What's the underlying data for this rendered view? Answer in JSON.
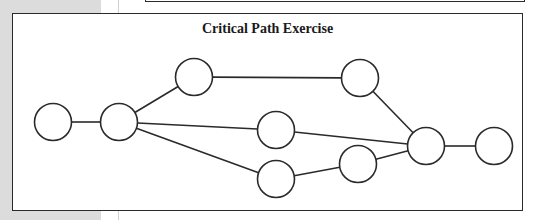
{
  "diagram": {
    "title": "Critical Path Exercise",
    "colors": {
      "stroke": "#2a2a2a",
      "node_fill": "#ffffff",
      "background": "#ffffff",
      "margin": "#dcdcdc"
    },
    "nodes": [
      {
        "id": "n1",
        "cx": 53,
        "cy": 122,
        "r": 18.5
      },
      {
        "id": "n2",
        "cx": 119,
        "cy": 122,
        "r": 18.5
      },
      {
        "id": "n3",
        "cx": 194,
        "cy": 77,
        "r": 18.5
      },
      {
        "id": "n4",
        "cx": 360,
        "cy": 78,
        "r": 18.5
      },
      {
        "id": "n5",
        "cx": 276,
        "cy": 130,
        "r": 18.5
      },
      {
        "id": "n6",
        "cx": 276,
        "cy": 179,
        "r": 18.5
      },
      {
        "id": "n7",
        "cx": 358,
        "cy": 164,
        "r": 18.5
      },
      {
        "id": "n8",
        "cx": 426,
        "cy": 146,
        "r": 18.5
      },
      {
        "id": "n9",
        "cx": 494,
        "cy": 146,
        "r": 18.5
      }
    ],
    "edges": [
      {
        "from": "n1",
        "to": "n2"
      },
      {
        "from": "n2",
        "to": "n3"
      },
      {
        "from": "n2",
        "to": "n5"
      },
      {
        "from": "n2",
        "to": "n6"
      },
      {
        "from": "n3",
        "to": "n4"
      },
      {
        "from": "n4",
        "to": "n8"
      },
      {
        "from": "n5",
        "to": "n8"
      },
      {
        "from": "n6",
        "to": "n7"
      },
      {
        "from": "n7",
        "to": "n8"
      },
      {
        "from": "n8",
        "to": "n9"
      }
    ]
  }
}
